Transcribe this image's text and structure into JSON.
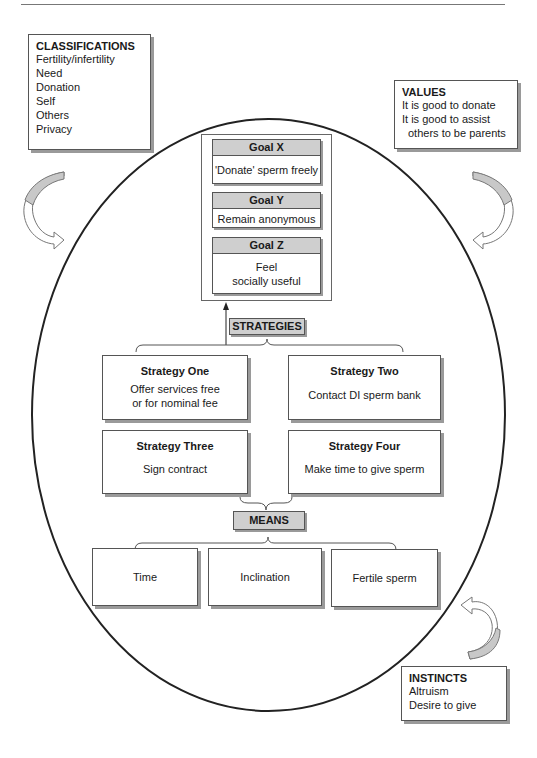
{
  "classifications": {
    "title": "CLASSIFICATIONS",
    "items": [
      "Fertility/infertility",
      "Need",
      "Donation",
      "Self",
      "Others",
      "Privacy"
    ]
  },
  "values": {
    "title": "VALUES",
    "items": [
      "It is good to donate",
      "It is good to assist",
      "others to be parents"
    ]
  },
  "instincts": {
    "title": "INSTINCTS",
    "items": [
      "Altruism",
      "Desire to give"
    ]
  },
  "goals": [
    {
      "title": "Goal X",
      "lines": [
        "'Donate' sperm freely"
      ]
    },
    {
      "title": "Goal Y",
      "lines": [
        "Remain anonymous"
      ]
    },
    {
      "title": "Goal Z",
      "lines": [
        "Feel",
        "socially useful"
      ]
    }
  ],
  "strategies_label": "STRATEGIES",
  "strategies": [
    {
      "title": "Strategy One",
      "lines": [
        "Offer services free",
        "or for nominal fee"
      ]
    },
    {
      "title": "Strategy Two",
      "lines": [
        "Contact DI sperm bank"
      ]
    },
    {
      "title": "Strategy Three",
      "lines": [
        "Sign contract"
      ]
    },
    {
      "title": "Strategy Four",
      "lines": [
        "Make time to give sperm"
      ]
    }
  ],
  "means_label": "MEANS",
  "means": [
    "Time",
    "Inclination",
    "Fertile sperm"
  ],
  "colors": {
    "header_fill": "#cfcfcf",
    "arrow_fill": "#c8c8c8",
    "outline": "#222222",
    "shadow": "#9a9a9a"
  }
}
